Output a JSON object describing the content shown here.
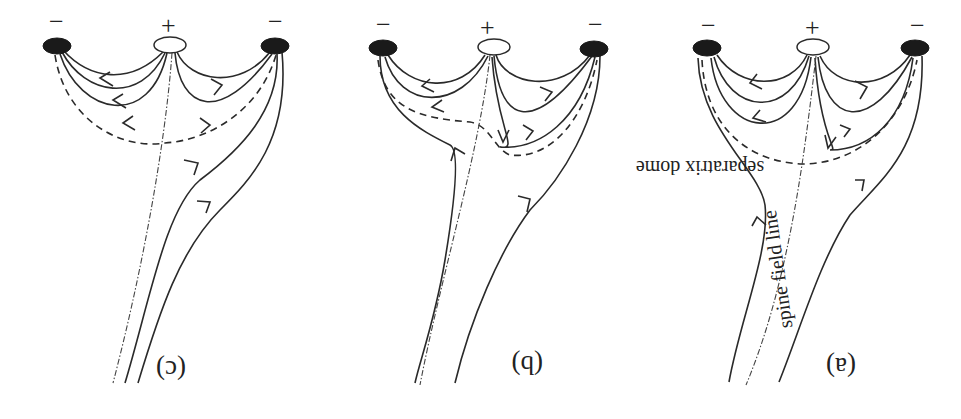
{
  "figure": {
    "colors": {
      "ink": "#2a2a2a",
      "negative_polarity": "#1a1a1a",
      "positive_polarity": "#ffffff",
      "background": "#ffffff"
    },
    "panels": [
      {
        "id": "c",
        "label": "(c)",
        "neg_left_sign": "−",
        "pos_sign": "+",
        "neg_right_sign": "−"
      },
      {
        "id": "b",
        "label": "(b)",
        "neg_left_sign": "−",
        "pos_sign": "+",
        "neg_right_sign": "−"
      },
      {
        "id": "a",
        "label": "(a)",
        "neg_left_sign": "−",
        "pos_sign": "+",
        "neg_right_sign": "−"
      }
    ],
    "annotations": {
      "separatrix": "separatrix dome",
      "spine": "spine field line"
    }
  }
}
